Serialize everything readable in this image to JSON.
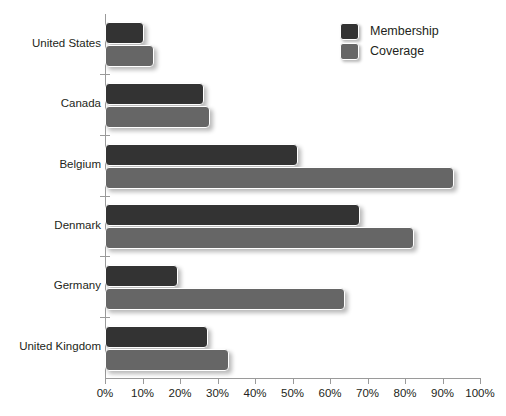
{
  "chart_data": {
    "type": "bar",
    "orientation": "horizontal",
    "title": "",
    "xlabel": "",
    "ylabel": "",
    "xlim": [
      0,
      100
    ],
    "xunit": "%",
    "grid": false,
    "legend_position": "top-right",
    "categories": [
      "United States",
      "Canada",
      "Belgium",
      "Denmark",
      "Germany",
      "United Kingdom"
    ],
    "xticks": [
      0,
      10,
      20,
      30,
      40,
      50,
      60,
      70,
      80,
      90,
      100
    ],
    "xtick_labels": [
      "0%",
      "10%",
      "20%",
      "30%",
      "40%",
      "50%",
      "60%",
      "70%",
      "80%",
      "90%",
      "100%"
    ],
    "series": [
      {
        "name": "Membership",
        "color": "#333333",
        "values": [
          10.5,
          26.5,
          51.5,
          68,
          19.5,
          27.5
        ]
      },
      {
        "name": "Coverage",
        "color": "#666666",
        "values": [
          13,
          28,
          93,
          82.5,
          64,
          33
        ]
      }
    ]
  },
  "legend": {
    "items": [
      {
        "label": "Membership",
        "swatch": "membership"
      },
      {
        "label": "Coverage",
        "swatch": "coverage"
      }
    ]
  }
}
